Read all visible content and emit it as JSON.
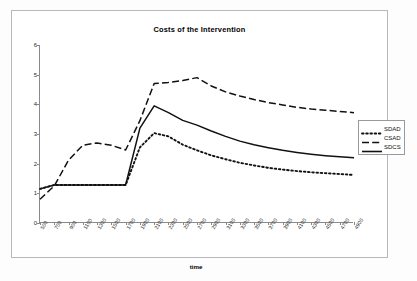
{
  "chart_data": {
    "type": "line",
    "title": "Costs of the Intervention",
    "xlabel": "time",
    "ylabel": "",
    "xlim": [
      500,
      4900
    ],
    "ylim": [
      0,
      6
    ],
    "yticks": [
      0,
      1,
      2,
      3,
      4,
      5,
      6
    ],
    "grid": false,
    "legend_position": "right-outside",
    "x": [
      500,
      700,
      900,
      1100,
      1300,
      1500,
      1700,
      1900,
      2100,
      2300,
      2500,
      2700,
      2900,
      3100,
      3300,
      3500,
      3700,
      3900,
      4100,
      4300,
      4500,
      4700,
      4900
    ],
    "xtick_labels": [
      "500",
      "700",
      "900",
      "1100",
      "1300",
      "1500",
      "1700",
      "1900",
      "2100",
      "2300",
      "2500",
      "2700",
      "2900",
      "3100",
      "3300",
      "3500",
      "3700",
      "3900",
      "4100",
      "4300",
      "4500",
      "4700",
      "4900"
    ],
    "series": [
      {
        "name": "SDAD",
        "style": "dotted",
        "color": "#111111",
        "values": [
          1.15,
          1.28,
          1.28,
          1.28,
          1.28,
          1.28,
          1.28,
          2.55,
          3.03,
          2.92,
          2.64,
          2.45,
          2.28,
          2.15,
          2.03,
          1.94,
          1.86,
          1.8,
          1.75,
          1.71,
          1.68,
          1.65,
          1.62
        ]
      },
      {
        "name": "CSAD",
        "style": "dashed",
        "color": "#111111",
        "values": [
          0.8,
          1.25,
          2.12,
          2.62,
          2.7,
          2.62,
          2.46,
          3.45,
          4.7,
          4.74,
          4.8,
          4.9,
          4.62,
          4.42,
          4.28,
          4.16,
          4.06,
          3.98,
          3.9,
          3.84,
          3.8,
          3.76,
          3.72
        ]
      },
      {
        "name": "SDCS",
        "style": "solid",
        "color": "#111111",
        "values": [
          1.15,
          1.28,
          1.28,
          1.28,
          1.28,
          1.28,
          1.28,
          3.2,
          3.95,
          3.72,
          3.46,
          3.3,
          3.1,
          2.92,
          2.76,
          2.64,
          2.54,
          2.45,
          2.38,
          2.32,
          2.27,
          2.23,
          2.2
        ]
      }
    ]
  },
  "legend": {
    "items": [
      {
        "label": "SDAD"
      },
      {
        "label": "CSAD"
      },
      {
        "label": "SDCS"
      }
    ]
  }
}
